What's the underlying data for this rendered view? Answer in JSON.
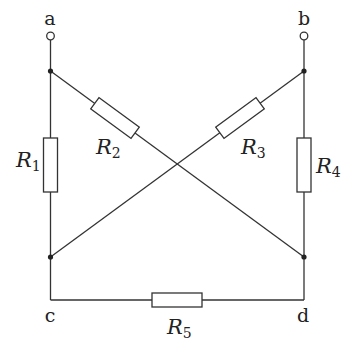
{
  "diagram": {
    "type": "resistor-network",
    "nodes": {
      "a": {
        "label": "a",
        "terminal": true
      },
      "b": {
        "label": "b",
        "terminal": true
      },
      "c": {
        "label": "c"
      },
      "d": {
        "label": "d"
      }
    },
    "resistors": [
      {
        "id": "R1",
        "letter": "R",
        "sub": "1",
        "from": "a",
        "to": "c"
      },
      {
        "id": "R2",
        "letter": "R",
        "sub": "2",
        "from": "a",
        "to": "d"
      },
      {
        "id": "R3",
        "letter": "R",
        "sub": "3",
        "from": "b",
        "to": "c"
      },
      {
        "id": "R4",
        "letter": "R",
        "sub": "4",
        "from": "b",
        "to": "d"
      },
      {
        "id": "R5",
        "letter": "R",
        "sub": "5",
        "from": "c",
        "to": "d"
      }
    ],
    "colors": {
      "line": "#333333",
      "background": "#ffffff"
    }
  }
}
